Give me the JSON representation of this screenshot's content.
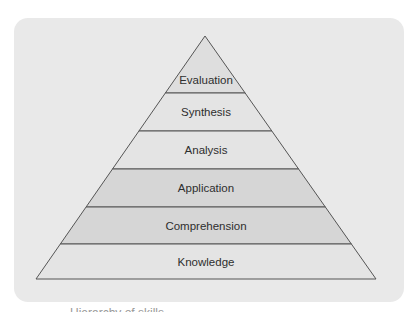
{
  "diagram": {
    "type": "pyramid",
    "apex": [
      205,
      36
    ],
    "base_left": [
      36,
      279
    ],
    "base_right": [
      376,
      279
    ],
    "layers": [
      {
        "label": "Evaluation",
        "top": 36,
        "bottom": 93,
        "fill": "#dedede"
      },
      {
        "label": "Synthesis",
        "top": 93,
        "bottom": 131,
        "fill": "#e4e4e4"
      },
      {
        "label": "Analysis",
        "top": 131,
        "bottom": 169,
        "fill": "#e4e4e4"
      },
      {
        "label": "Application",
        "top": 169,
        "bottom": 207,
        "fill": "#d6d6d6"
      },
      {
        "label": "Comprehension",
        "top": 207,
        "bottom": 244,
        "fill": "#d6d6d6"
      },
      {
        "label": "Knowledge",
        "top": 244,
        "bottom": 279,
        "fill": "#e4e4e4"
      }
    ],
    "colors": {
      "panel": "#e9e9e9",
      "stroke": "#555555",
      "text": "#2e2e2e"
    }
  },
  "caption": {
    "text": "Hierarchy of skills"
  }
}
